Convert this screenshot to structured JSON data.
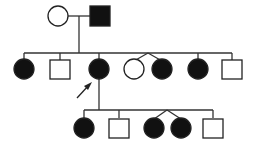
{
  "diagram": {
    "type": "pedigree",
    "colors": {
      "affected": "#111111",
      "unaffected": "#ffffff",
      "line": "#333333"
    },
    "generations": [
      {
        "id": "I",
        "members": [
          {
            "id": "I-1",
            "sex": "female",
            "affected": false
          },
          {
            "id": "I-2",
            "sex": "male",
            "affected": true
          }
        ]
      },
      {
        "id": "II",
        "members": [
          {
            "id": "II-1",
            "sex": "female",
            "affected": true
          },
          {
            "id": "II-2",
            "sex": "male",
            "affected": false
          },
          {
            "id": "II-3",
            "sex": "female",
            "affected": true,
            "proband": true
          },
          {
            "id": "II-4",
            "sex": "female",
            "affected": false,
            "twin_group": "A"
          },
          {
            "id": "II-5",
            "sex": "female",
            "affected": true,
            "twin_group": "A"
          },
          {
            "id": "II-6",
            "sex": "female",
            "affected": true
          },
          {
            "id": "II-7",
            "sex": "male",
            "affected": false
          }
        ]
      },
      {
        "id": "III",
        "parent": "II-3",
        "members": [
          {
            "id": "III-1",
            "sex": "female",
            "affected": true
          },
          {
            "id": "III-2",
            "sex": "male",
            "affected": false
          },
          {
            "id": "III-3",
            "sex": "female",
            "affected": true,
            "twin_group": "B"
          },
          {
            "id": "III-4",
            "sex": "female",
            "affected": true,
            "twin_group": "B"
          },
          {
            "id": "III-5",
            "sex": "male",
            "affected": false
          }
        ]
      }
    ],
    "proband_marker": "arrow pointing to II-3"
  }
}
